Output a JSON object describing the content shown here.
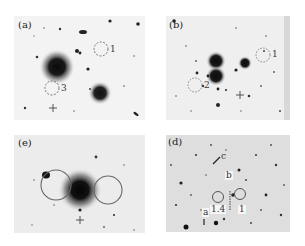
{
  "figure": {
    "panels": [
      {
        "id": "a",
        "label": "(a)",
        "bounds": [
          14,
          16,
          131,
          104
        ],
        "background": "#f3f3f3",
        "apertures": [
          {
            "label": "1",
            "style": "dashed"
          },
          {
            "label": "3",
            "style": "dashed"
          }
        ]
      },
      {
        "id": "b",
        "label": "(b)",
        "bounds": [
          166,
          16,
          124,
          104
        ],
        "background": "#efefef",
        "apertures": [
          {
            "label": "1",
            "style": "dashed"
          },
          {
            "label": "2",
            "style": "dashed"
          }
        ]
      },
      {
        "id": "e",
        "label": "(e)",
        "bounds": [
          14,
          135,
          131,
          98
        ],
        "background": "#ececec",
        "apertures": [
          {
            "label": "",
            "style": "solid"
          },
          {
            "label": "",
            "style": "solid"
          }
        ]
      },
      {
        "id": "d",
        "label": "(d)",
        "bounds": [
          166,
          135,
          124,
          97
        ],
        "background": "#dedede",
        "apertures": [
          {
            "label": "1.4",
            "style": "solid"
          },
          {
            "label": "1",
            "style": "solid"
          }
        ],
        "markers": [
          {
            "label": "a"
          },
          {
            "label": "b"
          },
          {
            "label": "c"
          }
        ]
      }
    ],
    "colors": {
      "aperture": "#555555",
      "source": "#111111"
    }
  }
}
